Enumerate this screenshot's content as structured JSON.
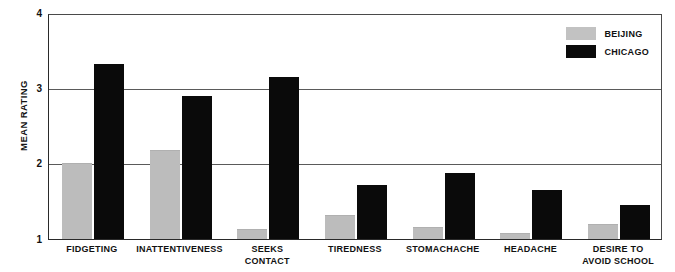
{
  "chart_data": {
    "type": "bar",
    "title": "",
    "xlabel": "",
    "ylabel": "MEAN RATING",
    "ylim": [
      1,
      4
    ],
    "yticks": [
      "1",
      "2",
      "3",
      "4"
    ],
    "grid": true,
    "legend_position": "top-right",
    "categories": [
      "FIDGETING",
      "INATTENTIVENESS",
      "SEEKS CONTACT",
      "TIREDNESS",
      "STOMACHACHE",
      "HEADACHE",
      "DESIRE TO AVOID SCHOOL"
    ],
    "category_lines": [
      [
        "FIDGETING"
      ],
      [
        "INATTENTIVENESS"
      ],
      [
        "SEEKS",
        "CONTACT"
      ],
      [
        "TIREDNESS"
      ],
      [
        "STOMACHACHE"
      ],
      [
        "HEADACHE"
      ],
      [
        "DESIRE TO",
        "AVOID SCHOOL"
      ]
    ],
    "series": [
      {
        "name": "BEIJING",
        "color": "#c2c2c2",
        "values": [
          2.0,
          2.17,
          1.12,
          1.3,
          1.15,
          1.07,
          1.18
        ]
      },
      {
        "name": "CHICAGO",
        "color": "#0a0a0a",
        "values": [
          3.32,
          2.9,
          3.15,
          1.72,
          1.87,
          1.65,
          1.45
        ]
      }
    ]
  },
  "legend": {
    "items": [
      {
        "label": "BEIJING",
        "swatch": "beijing"
      },
      {
        "label": "CHICAGO",
        "swatch": "chicago"
      }
    ]
  },
  "axis": {
    "y_title": "MEAN RATING",
    "y_tick_4": "4",
    "y_tick_3": "3",
    "y_tick_2": "2",
    "y_tick_1": "1"
  }
}
